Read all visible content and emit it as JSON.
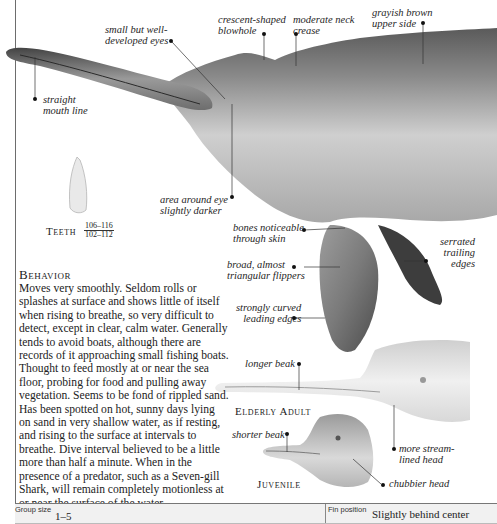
{
  "main_illustration": {
    "subject": "adult dolphin, head and forebody",
    "labels": {
      "eyes": "small but well-\ndeveloped eyes",
      "mouth": "straight\nmouth line",
      "blowhole": "crescent-shaped\nblowhole",
      "neck": "moderate neck\ncrease",
      "upper_side": "grayish brown\nupper side",
      "eye_area": "area around eye\nslightly darker",
      "bones": "bones noticeable\nthrough skin",
      "flippers": "broad, almost\ntriangular flippers",
      "leading_edges": "strongly curved\nleading edges",
      "trailing_edges": "serrated\ntrailing\nedges"
    }
  },
  "teeth": {
    "caption": "Teeth",
    "upper": "106–116",
    "lower": "102–112"
  },
  "behavior": {
    "title": "Behavior",
    "text": "Moves very smoothly. Seldom rolls or splashes at surface and shows little of itself when rising to breathe, so very difficult to detect, except in clear, calm water. Generally tends to avoid boats, although there are records of it approaching small fishing boats. Thought to feed mostly at or near the sea floor, probing for food and pulling away vegetation. Seems to be fond of rippled sand. Has been spotted on hot, sunny days lying on sand in very shallow water, as if resting, and rising to the surface at intervals to breathe. Dive interval believed to be a little more than half a minute. When in the presence of a predator, such as a Seven-gill Shark, will remain completely motionless at or near the surface of the water."
  },
  "elderly_adult": {
    "caption": "Elderly Adult",
    "labels": {
      "beak": "longer beak",
      "head": "more stream-\nlined head"
    }
  },
  "juvenile": {
    "caption": "Juvenile",
    "labels": {
      "beak": "shorter beak",
      "head": "chubbier head"
    }
  },
  "footer": {
    "group_size_label": "Group size",
    "group_size_value": "1–5",
    "fin_position_label": "Fin position",
    "fin_position_value": "Slightly behind center"
  }
}
